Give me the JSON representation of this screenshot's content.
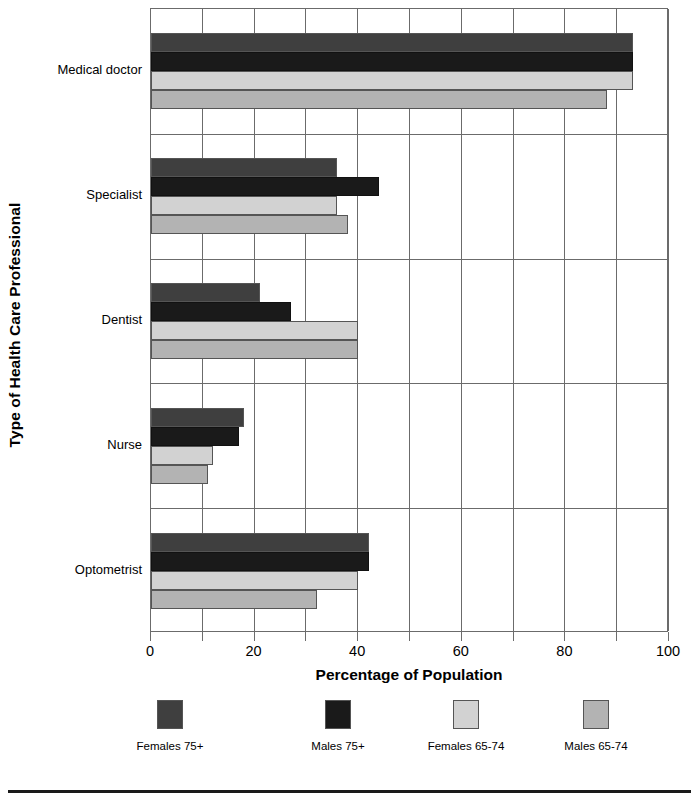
{
  "chart_data": {
    "type": "bar",
    "orientation": "horizontal",
    "title": "",
    "xlabel": "Percentage of Population",
    "ylabel": "Type of Health Care Professional",
    "categories": [
      "Medical doctor",
      "Specialist",
      "Dentist",
      "Nurse",
      "Optometrist"
    ],
    "series": [
      {
        "name": "Females 75+",
        "color": "#3f3f3f",
        "values": [
          93,
          36,
          21,
          18,
          42
        ]
      },
      {
        "name": "Males 75+",
        "color": "#1a1a1a",
        "values": [
          93,
          44,
          27,
          17,
          42
        ]
      },
      {
        "name": "Females 65-74",
        "color": "#d2d2d2",
        "values": [
          93,
          36,
          40,
          12,
          40
        ]
      },
      {
        "name": "Males 65-74",
        "color": "#b3b3b3",
        "values": [
          88,
          38,
          40,
          11,
          32
        ]
      }
    ],
    "xlim": [
      0,
      100
    ],
    "xticks": [
      0,
      10,
      20,
      30,
      40,
      50,
      60,
      70,
      80,
      90,
      100
    ],
    "xticklabels": [
      "0",
      "",
      "20",
      "",
      "40",
      "",
      "60",
      "",
      "80",
      "",
      "100"
    ],
    "grid": "vertical-and-category-separators",
    "legend_position": "bottom"
  },
  "legend": {
    "entries": [
      {
        "label": "Females 75+",
        "color": "#3f3f3f"
      },
      {
        "label": "Males 75+",
        "color": "#1a1a1a"
      },
      {
        "label": "Females 65-74",
        "color": "#d2d2d2"
      },
      {
        "label": "Males 65-74",
        "color": "#b3b3b3"
      }
    ]
  }
}
